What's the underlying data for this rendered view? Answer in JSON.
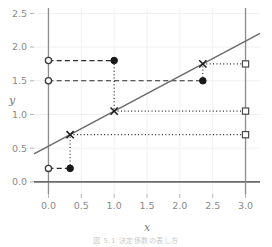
{
  "chart_data": {
    "type": "scatter",
    "title": "",
    "xlabel": "x",
    "ylabel": "y",
    "xlim": [
      -0.22,
      3.22
    ],
    "ylim": [
      -0.18,
      2.58
    ],
    "xticks": [
      0.0,
      0.5,
      1.0,
      1.5,
      2.0,
      2.5,
      3.0
    ],
    "xticklabels": [
      "0.0",
      "0.5",
      "1.0",
      "1.5",
      "2.0",
      "2.5",
      "3.0"
    ],
    "yticks": [
      0.0,
      0.5,
      1.0,
      1.5,
      2.0,
      2.5
    ],
    "yticklabels": [
      "0.0",
      "0.5",
      "1.0",
      "1.5",
      "2.0",
      "2.5"
    ],
    "grid": true,
    "legend": "none",
    "reference_lines": [
      {
        "name": "y-axis-zero-vertical",
        "x": 0.0,
        "color": "#8c8c8c"
      },
      {
        "name": "x-axis-zero-horizontal",
        "y": 0.0,
        "color": "#6b6b6b"
      },
      {
        "name": "x-equals-three-vertical",
        "x": 3.0,
        "color": "#8c8c8c"
      }
    ],
    "fit_line": {
      "name": "regression-line",
      "slope": 0.52,
      "intercept": 0.53,
      "x_start": -0.22,
      "x_end": 3.22,
      "color": "#6b6b6b"
    },
    "series": [
      {
        "name": "open-circles-on-y-axis",
        "marker": "open-circle",
        "color": "#3a3a3a",
        "points": [
          {
            "x": 0.0,
            "y": 1.8
          },
          {
            "x": 0.0,
            "y": 1.5
          },
          {
            "x": 0.0,
            "y": 0.2
          }
        ]
      },
      {
        "name": "filled-circles",
        "marker": "filled-circle",
        "color": "#1a1a1a",
        "points": [
          {
            "x": 1.0,
            "y": 1.8
          },
          {
            "x": 2.35,
            "y": 1.5
          },
          {
            "x": 0.33,
            "y": 0.2
          }
        ]
      },
      {
        "name": "x-markers-on-line",
        "marker": "x-cross",
        "color": "#1a1a1a",
        "points": [
          {
            "x": 1.0,
            "y": 1.05
          },
          {
            "x": 2.35,
            "y": 1.75
          },
          {
            "x": 0.33,
            "y": 0.7
          }
        ]
      },
      {
        "name": "open-squares-at-x-three",
        "marker": "open-square",
        "color": "#4a4a4a",
        "points": [
          {
            "x": 3.0,
            "y": 1.75
          },
          {
            "x": 3.0,
            "y": 1.05
          },
          {
            "x": 3.0,
            "y": 0.7
          }
        ]
      }
    ],
    "connectors": [
      {
        "name": "dashed-connector-top",
        "style": "dashed",
        "from": {
          "x": 0.0,
          "y": 1.8
        },
        "to": {
          "x": 1.0,
          "y": 1.8
        }
      },
      {
        "name": "dashed-connector-middle",
        "style": "dashed",
        "from": {
          "x": 0.0,
          "y": 1.5
        },
        "to": {
          "x": 2.35,
          "y": 1.5
        }
      },
      {
        "name": "dashed-connector-bottom",
        "style": "dashed",
        "from": {
          "x": 0.0,
          "y": 0.2
        },
        "to": {
          "x": 0.33,
          "y": 0.2
        }
      },
      {
        "name": "dotted-vertical-left",
        "style": "dotted",
        "from": {
          "x": 0.33,
          "y": 0.2
        },
        "to": {
          "x": 0.33,
          "y": 0.7
        }
      },
      {
        "name": "dotted-vertical-middle",
        "style": "dotted",
        "from": {
          "x": 1.0,
          "y": 1.8
        },
        "to": {
          "x": 1.0,
          "y": 1.05
        }
      },
      {
        "name": "dotted-vertical-right",
        "style": "dotted",
        "from": {
          "x": 2.35,
          "y": 1.5
        },
        "to": {
          "x": 2.35,
          "y": 1.75
        }
      },
      {
        "name": "dotted-horizontal-low",
        "style": "dotted",
        "from": {
          "x": 0.33,
          "y": 0.7
        },
        "to": {
          "x": 3.0,
          "y": 0.7
        }
      },
      {
        "name": "dotted-horizontal-mid",
        "style": "dotted",
        "from": {
          "x": 1.0,
          "y": 1.05
        },
        "to": {
          "x": 3.0,
          "y": 1.05
        }
      },
      {
        "name": "dotted-horizontal-high",
        "style": "dotted",
        "from": {
          "x": 2.35,
          "y": 1.75
        },
        "to": {
          "x": 3.0,
          "y": 1.75
        }
      }
    ]
  },
  "figure": {
    "caption": "図 5.1  決定係数の表し方"
  }
}
